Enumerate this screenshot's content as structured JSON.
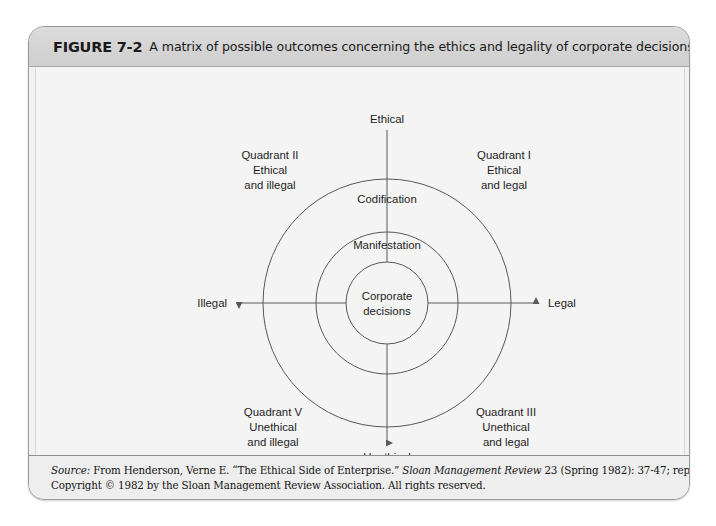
{
  "figure": {
    "number": "FIGURE 7-2",
    "caption": "A matrix of possible outcomes concerning the ethics and legality of corporate decisions"
  },
  "diagram": {
    "type": "matrix-quadrant-concentric",
    "axes": {
      "top": "Ethical",
      "bottom": "Unethical",
      "left": "Illegal",
      "right": "Legal"
    },
    "rings": [
      {
        "name": "outer",
        "label": "Codification"
      },
      {
        "name": "middle",
        "label": "Manifestation"
      },
      {
        "name": "inner",
        "label_line1": "Corporate",
        "label_line2": "decisions"
      }
    ],
    "quadrants": [
      {
        "id": "quadrant-2",
        "position": "top-left",
        "title": "Quadrant II",
        "line1": "Ethical",
        "line2": "and illegal"
      },
      {
        "id": "quadrant-1",
        "position": "top-right",
        "title": "Quadrant I",
        "line1": "Ethical",
        "line2": "and legal"
      },
      {
        "id": "quadrant-5",
        "position": "bottom-left",
        "title": "Quadrant V",
        "line1": "Unethical",
        "line2": "and illegal"
      },
      {
        "id": "quadrant-3",
        "position": "bottom-right",
        "title": "Quadrant III",
        "line1": "Unethical",
        "line2": "and legal"
      }
    ],
    "colors": {
      "stroke": "#55595c",
      "plate_background": "#f4f4f4",
      "text": "#1d1d1d"
    }
  },
  "source": {
    "label": "Source:",
    "line1_a": " From Henderson, Verne E. “The Ethical Side of Enterprise.” ",
    "line1_journal": "Sloan Management Review",
    "line1_b": " 23 (Spring 1982): 37-47; reprinted by permission.",
    "line2": "Copyright © 1982 by the Sloan Management Review Association. All rights reserved."
  }
}
